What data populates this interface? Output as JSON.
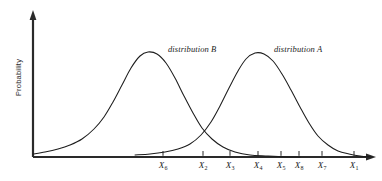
{
  "figure": {
    "title": "",
    "y_axis_label": "Probability",
    "background_color": "#ffffff",
    "line_color": "#1c1c1c",
    "axis_color": "#2a2a2a"
  },
  "curve_labels": {
    "b": "distribution B",
    "a": "distribution A"
  },
  "ticks": [
    {
      "label": "X",
      "sub": "6",
      "x": 163
    },
    {
      "label": "X",
      "sub": "2",
      "x": 203
    },
    {
      "label": "X",
      "sub": "3",
      "x": 230
    },
    {
      "label": "X",
      "sub": "4",
      "x": 258
    },
    {
      "label": "X",
      "sub": "5",
      "x": 281
    },
    {
      "label": "X",
      "sub": "8",
      "x": 299
    },
    {
      "label": "X",
      "sub": "7",
      "x": 322
    },
    {
      "label": "X",
      "sub": "1",
      "x": 354
    }
  ],
  "chart_data": {
    "type": "line",
    "title": "",
    "xlabel": "",
    "ylabel": "Probability",
    "grid": false,
    "legend": "inline-annotations",
    "axis_pixel_geometry": {
      "y_axis_x": 33,
      "baseline_y": 157,
      "y_axis_top_y": 12,
      "x_axis_right_x": 375
    },
    "xlim": [
      33,
      375
    ],
    "ylim": [
      0,
      1
    ],
    "tick_positions_px": [
      163,
      203,
      230,
      258,
      281,
      299,
      322,
      354
    ],
    "tick_labels": [
      "X6",
      "X2",
      "X3",
      "X4",
      "X5",
      "X8",
      "X7",
      "X1"
    ],
    "series": [
      {
        "name": "distribution B",
        "kind": "normal-density",
        "peak_x_px": 145,
        "peak_y_px": 52,
        "peak_height_norm": 1.0,
        "left_tail_start_px": 33,
        "right_tail_end_px": 300,
        "spread_px": 48,
        "points": [
          [
            33,
            154
          ],
          [
            45,
            152
          ],
          [
            58,
            149
          ],
          [
            70,
            145
          ],
          [
            82,
            139
          ],
          [
            94,
            129
          ],
          [
            104,
            117
          ],
          [
            113,
            102
          ],
          [
            122,
            85
          ],
          [
            131,
            68
          ],
          [
            140,
            56
          ],
          [
            148,
            52
          ],
          [
            157,
            54
          ],
          [
            166,
            63
          ],
          [
            175,
            78
          ],
          [
            184,
            96
          ],
          [
            193,
            113
          ],
          [
            202,
            128
          ],
          [
            212,
            139
          ],
          [
            223,
            147
          ],
          [
            235,
            152
          ],
          [
            250,
            155
          ],
          [
            268,
            156
          ],
          [
            288,
            157
          ],
          [
            300,
            157
          ]
        ]
      },
      {
        "name": "distribution A",
        "kind": "normal-density",
        "peak_x_px": 253,
        "peak_y_px": 53,
        "peak_height_norm": 1.0,
        "left_tail_start_px": 135,
        "right_tail_end_px": 372,
        "spread_px": 45,
        "points": [
          [
            135,
            155
          ],
          [
            150,
            154
          ],
          [
            165,
            152
          ],
          [
            178,
            149
          ],
          [
            190,
            144
          ],
          [
            201,
            135
          ],
          [
            211,
            122
          ],
          [
            220,
            106
          ],
          [
            229,
            88
          ],
          [
            238,
            71
          ],
          [
            246,
            59
          ],
          [
            255,
            53
          ],
          [
            264,
            54
          ],
          [
            273,
            61
          ],
          [
            282,
            74
          ],
          [
            291,
            90
          ],
          [
            300,
            107
          ],
          [
            309,
            123
          ],
          [
            318,
            136
          ],
          [
            328,
            145
          ],
          [
            338,
            151
          ],
          [
            349,
            154
          ],
          [
            360,
            156
          ],
          [
            372,
            157
          ]
        ]
      }
    ]
  }
}
